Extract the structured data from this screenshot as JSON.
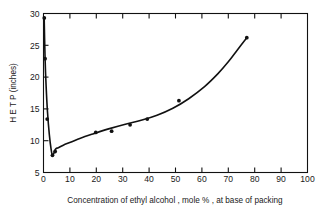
{
  "chart_data": {
    "type": "line",
    "title": "",
    "xlabel": "Concentration of ethyl alcohol , mole % , at base of packing",
    "ylabel": "H E T P (inches)",
    "xlim": [
      0,
      100
    ],
    "ylim": [
      5,
      30
    ],
    "xticks": [
      0,
      10,
      20,
      30,
      40,
      50,
      60,
      70,
      80,
      90,
      100
    ],
    "xticklabels": [
      "0",
      "10",
      "20",
      "30",
      "40",
      "50",
      "60",
      "70",
      "80",
      "90",
      "100"
    ],
    "yticks": [
      5,
      10,
      15,
      20,
      25,
      30
    ],
    "yticklabels": [
      "5",
      "10",
      "15",
      "20",
      "25",
      "30"
    ],
    "grid": false,
    "legend": null,
    "series": [
      {
        "name": "HETP vs ethyl alcohol concentration",
        "marker": "filled-circle",
        "line": "solid",
        "color": "#111111",
        "x": [
          0.3,
          0.6,
          1.4,
          3.4,
          4.4,
          19.8,
          25.8,
          32.8,
          39.3,
          51.3,
          77.0
        ],
        "y": [
          29.3,
          22.9,
          13.4,
          7.7,
          8.3,
          11.3,
          11.5,
          12.5,
          13.4,
          16.3,
          26.2
        ]
      }
    ],
    "curve_path_x": [
      0.25,
      0.6,
      1.0,
      1.5,
      2.2,
      2.9,
      3.4,
      3.9,
      4.6,
      5.6,
      7.5,
      10.5,
      14.0,
      19.0,
      25.0,
      31.0,
      37.0,
      43.0,
      49.0,
      55.0,
      61.0,
      66.0,
      70.0,
      73.5,
      77.0
    ],
    "curve_path_y": [
      29.4,
      22.9,
      18.5,
      14.6,
      11.0,
      8.6,
      7.7,
      8.0,
      8.7,
      8.9,
      9.3,
      9.8,
      10.4,
      11.1,
      11.9,
      12.6,
      13.2,
      14.0,
      15.1,
      16.6,
      18.5,
      20.5,
      22.4,
      24.3,
      26.2
    ]
  }
}
